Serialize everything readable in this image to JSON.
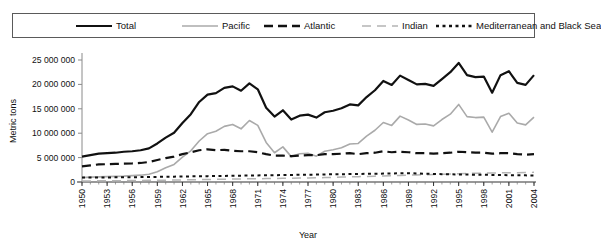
{
  "chart_data": {
    "type": "line",
    "title": "",
    "xlabel": "Year",
    "ylabel": "Metric tons",
    "xlim": [
      1950,
      2004
    ],
    "ylim": [
      0,
      25000000
    ],
    "ytick_values": [
      0,
      5000000,
      10000000,
      15000000,
      20000000,
      25000000
    ],
    "ytick_labels": [
      "0",
      "5 000 000",
      "10 000 000",
      "15 000 000",
      "20 000 000",
      "25 000 000"
    ],
    "xtick_values": [
      1950,
      1953,
      1956,
      1959,
      1962,
      1965,
      1968,
      1971,
      1974,
      1977,
      1980,
      1983,
      1986,
      1989,
      1992,
      1995,
      1998,
      2001,
      2004
    ],
    "xtick_labels": [
      "1950",
      "1953",
      "1956",
      "1959",
      "1962",
      "1965",
      "1968",
      "1971",
      "1974",
      "1977",
      "1980",
      "1983",
      "1986",
      "1989",
      "1992",
      "1995",
      "1998",
      "2001",
      "2004"
    ],
    "grid": false,
    "legend_position": "top",
    "x": [
      1950,
      1951,
      1952,
      1953,
      1954,
      1955,
      1956,
      1957,
      1958,
      1959,
      1960,
      1961,
      1962,
      1963,
      1964,
      1965,
      1966,
      1967,
      1968,
      1969,
      1970,
      1971,
      1972,
      1973,
      1974,
      1975,
      1976,
      1977,
      1978,
      1979,
      1980,
      1981,
      1982,
      1983,
      1984,
      1985,
      1986,
      1987,
      1988,
      1989,
      1990,
      1991,
      1992,
      1993,
      1994,
      1995,
      1996,
      1997,
      1998,
      1999,
      2000,
      2001,
      2002,
      2003,
      2004
    ],
    "series": [
      {
        "name": "Total",
        "style": "solid",
        "color": "#111111",
        "width": 2.2,
        "values": [
          5200000,
          5500000,
          5800000,
          5900000,
          6000000,
          6200000,
          6300000,
          6500000,
          6900000,
          7900000,
          9100000,
          10100000,
          12100000,
          13900000,
          16400000,
          17900000,
          18200000,
          19300000,
          19600000,
          18700000,
          20200000,
          19000000,
          15200000,
          13400000,
          14700000,
          12800000,
          13600000,
          13800000,
          13200000,
          14300000,
          14600000,
          15100000,
          15900000,
          15700000,
          17400000,
          18800000,
          20700000,
          19900000,
          21800000,
          20900000,
          20000000,
          20100000,
          19700000,
          21100000,
          22500000,
          24400000,
          21900000,
          21500000,
          21600000,
          18300000,
          21900000,
          22700000,
          20300000,
          19900000,
          21900000
        ]
      },
      {
        "name": "Pacific",
        "style": "solid",
        "color": "#aaaaaa",
        "width": 1.6,
        "values": [
          900000,
          1000000,
          1050000,
          1100000,
          1150000,
          1200000,
          1300000,
          1400000,
          1600000,
          2100000,
          2900000,
          3600000,
          5100000,
          6400000,
          8400000,
          9900000,
          10400000,
          11400000,
          11800000,
          10900000,
          12600000,
          11600000,
          8100000,
          6000000,
          7200000,
          5200000,
          5800000,
          5900000,
          5300000,
          6300000,
          6600000,
          7000000,
          7800000,
          7900000,
          9400000,
          10600000,
          12200000,
          11600000,
          13500000,
          12700000,
          11800000,
          11900000,
          11500000,
          12800000,
          13900000,
          15900000,
          13400000,
          13200000,
          13300000,
          10200000,
          13400000,
          14100000,
          12100000,
          11700000,
          13300000
        ]
      },
      {
        "name": "Atlantic",
        "style": "dashed",
        "color": "#111111",
        "width": 2.2,
        "values": [
          3200000,
          3400000,
          3600000,
          3650000,
          3700000,
          3750000,
          3800000,
          3900000,
          4100000,
          4500000,
          4900000,
          5200000,
          5700000,
          6100000,
          6500000,
          6700000,
          6500000,
          6600000,
          6400000,
          6300000,
          6300000,
          6100000,
          5700000,
          5400000,
          5400000,
          5300000,
          5400000,
          5500000,
          5500000,
          5700000,
          5700000,
          5800000,
          5900000,
          5700000,
          5900000,
          6000000,
          6300000,
          6100000,
          6200000,
          6100000,
          5900000,
          5900000,
          5800000,
          5900000,
          6000000,
          6200000,
          6100000,
          6000000,
          6000000,
          5800000,
          5900000,
          5900000,
          5700000,
          5600000,
          5700000
        ]
      },
      {
        "name": "Indian",
        "style": "dashed-light",
        "color": "#b4b4b4",
        "width": 1.5,
        "values": [
          200000,
          220000,
          240000,
          250000,
          260000,
          280000,
          300000,
          320000,
          340000,
          360000,
          380000,
          400000,
          430000,
          460000,
          490000,
          520000,
          550000,
          580000,
          600000,
          620000,
          650000,
          680000,
          700000,
          720000,
          750000,
          780000,
          800000,
          830000,
          860000,
          900000,
          950000,
          1000000,
          1050000,
          1100000,
          1150000,
          1200000,
          1250000,
          1300000,
          1350000,
          1400000,
          1450000,
          1500000,
          1550000,
          1600000,
          1650000,
          1700000,
          1750000,
          1800000,
          1820000,
          1850000,
          1880000,
          1900000,
          1920000,
          1950000,
          1980000
        ]
      },
      {
        "name": "Mediterranean and Black Sea",
        "style": "dotted",
        "color": "#111111",
        "width": 2.0,
        "values": [
          900000,
          920000,
          930000,
          940000,
          950000,
          960000,
          980000,
          1000000,
          1020000,
          1050000,
          1080000,
          1100000,
          1120000,
          1150000,
          1180000,
          1200000,
          1230000,
          1250000,
          1280000,
          1300000,
          1320000,
          1350000,
          1380000,
          1400000,
          1420000,
          1450000,
          1480000,
          1500000,
          1520000,
          1550000,
          1580000,
          1600000,
          1620000,
          1650000,
          1680000,
          1700000,
          1720000,
          1750000,
          1780000,
          1800000,
          1750000,
          1700000,
          1650000,
          1600000,
          1580000,
          1550000,
          1520000,
          1500000,
          1480000,
          1450000,
          1430000,
          1400000,
          1380000,
          1360000,
          1340000
        ]
      }
    ]
  },
  "legend": {
    "items": [
      {
        "label": "Total",
        "style": "solid",
        "color": "#111111"
      },
      {
        "label": "Pacific",
        "style": "solid",
        "color": "#aaaaaa"
      },
      {
        "label": "Atlantic",
        "style": "dashed",
        "color": "#111111"
      },
      {
        "label": "Indian",
        "style": "dashed-light",
        "color": "#b4b4b4"
      },
      {
        "label": "Mediterranean and Black Sea",
        "style": "dotted",
        "color": "#111111"
      }
    ]
  }
}
